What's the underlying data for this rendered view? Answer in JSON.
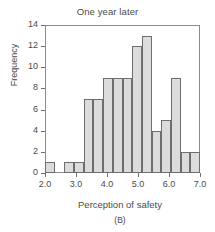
{
  "chart_data": {
    "type": "bar",
    "title": "One year later",
    "xlabel": "Perception of safety",
    "ylabel": "Frequency",
    "panel": "(B)",
    "grid": false,
    "legend": null,
    "xlim": [
      2.0,
      7.0
    ],
    "ylim": [
      0,
      14
    ],
    "bin_width": 0.3125,
    "xticks": [
      2.0,
      3.0,
      4.0,
      5.0,
      6.0,
      7.0
    ],
    "xtick_labels": [
      "2.0",
      "3.0",
      "4.0",
      "5.0",
      "6.0",
      "7.0"
    ],
    "yticks": [
      0,
      2,
      4,
      6,
      8,
      10,
      12,
      14
    ],
    "ytick_labels": [
      "0",
      "2",
      "4",
      "6",
      "8",
      "10",
      "12",
      "14"
    ],
    "bin_starts": [
      2.0,
      2.3125,
      2.625,
      2.9375,
      3.25,
      3.5625,
      3.875,
      4.1875,
      4.5,
      4.8125,
      5.125,
      5.4375,
      5.75,
      6.0625,
      6.375,
      6.6875
    ],
    "bin_ends": [
      2.3125,
      2.625,
      2.9375,
      3.25,
      3.5625,
      3.875,
      4.1875,
      4.5,
      4.8125,
      5.125,
      5.4375,
      5.75,
      6.0625,
      6.375,
      6.6875,
      7.0
    ],
    "categories": [
      "2.00-2.31",
      "2.31-2.63",
      "2.63-2.94",
      "2.94-3.25",
      "3.25-3.56",
      "3.56-3.88",
      "3.88-4.19",
      "4.19-4.50",
      "4.50-4.81",
      "4.81-5.13",
      "5.13-5.44",
      "5.44-5.75",
      "5.75-6.06",
      "6.06-6.38",
      "6.38-6.69",
      "6.69-7.00"
    ],
    "values": [
      1,
      0,
      1,
      1,
      7,
      7,
      9,
      9,
      9,
      12,
      13,
      4,
      5,
      9,
      2,
      2
    ],
    "bar_fill_color": "#dcdcdc",
    "bar_edge_color": "#6e6e6e",
    "axis_color": "#8c8c8c",
    "text_color": "#4a4a4a",
    "background_color": "#ffffff"
  }
}
